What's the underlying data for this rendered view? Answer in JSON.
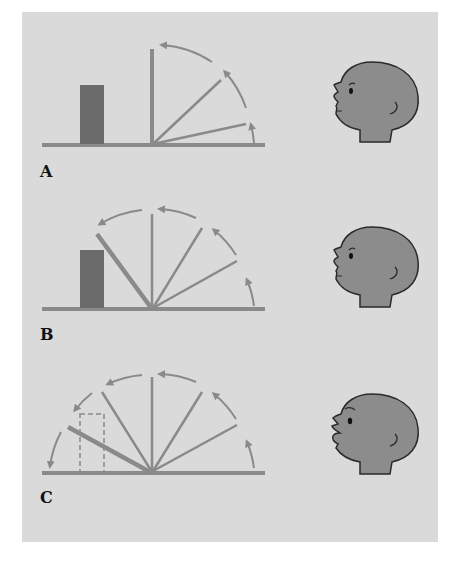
{
  "figure": {
    "colors": {
      "background": "#dadada",
      "floor": "#8a8a8a",
      "screen": "#8a8a8a",
      "box": "#6b6b6b",
      "arc": "#8a8a8a",
      "head": "#8c8c8c",
      "outline": "#2a2a2a"
    },
    "panels": [
      {
        "label": "A",
        "box": "solid",
        "screen_angles_deg": [
          0,
          12,
          38,
          90
        ],
        "head_expression": "neutral"
      },
      {
        "label": "B",
        "box": "solid",
        "screen_angles_deg": [
          0,
          25,
          55,
          90,
          120
        ],
        "head_expression": "neutral"
      },
      {
        "label": "C",
        "box": "dashed (hidden / absent)",
        "screen_angles_deg": [
          0,
          28,
          60,
          90,
          120,
          160,
          180
        ],
        "head_expression": "surprised (open mouth)"
      }
    ]
  }
}
